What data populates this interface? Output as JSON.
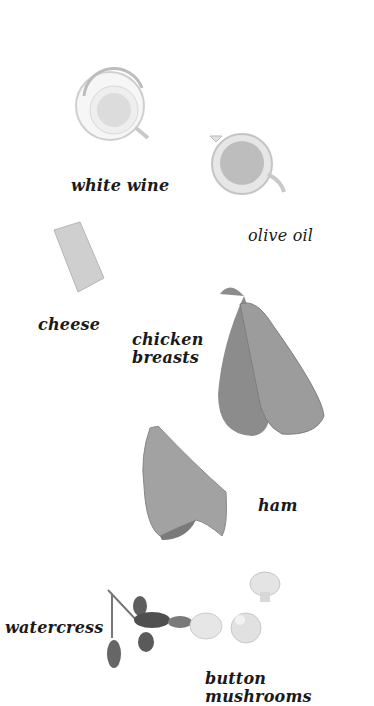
{
  "page": {
    "type": "cookbook-ingredients-illustration",
    "background": "#ffffff"
  },
  "ingredients": [
    {
      "label": "white wine",
      "image": "glass-bowl-white-wine"
    },
    {
      "label": "olive oil",
      "image": "glass-jug-olive-oil"
    },
    {
      "label": "cheese",
      "image": "cheese-block"
    },
    {
      "label": "chicken",
      "label_line2": "breasts",
      "image": "chicken-breasts"
    },
    {
      "label": "ham",
      "image": "ham-slice"
    },
    {
      "label": "watercress",
      "image": "watercress-sprig"
    },
    {
      "label": "button mushrooms",
      "image": "button-mushrooms"
    }
  ]
}
